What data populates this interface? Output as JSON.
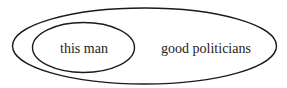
{
  "diagram": {
    "type": "euler",
    "sets": [
      {
        "id": "outer",
        "label": "good politicians"
      },
      {
        "id": "inner",
        "label": "this man",
        "contained_in": "outer"
      }
    ],
    "stroke_color": "#1a1a1a",
    "background": "#ffffff"
  }
}
